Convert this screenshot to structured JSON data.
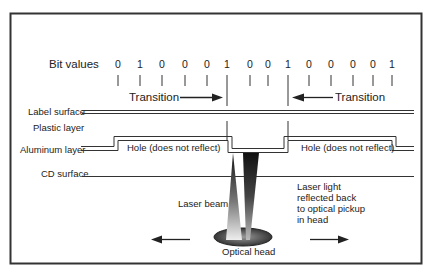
{
  "diagram": {
    "title_label": "Bit values",
    "bits": [
      "0",
      "1",
      "0",
      "0",
      "0",
      "1",
      "0",
      "0",
      "1",
      "0",
      "0",
      "0",
      "0",
      "1"
    ],
    "bit_x": [
      118,
      140,
      162,
      185,
      207,
      227,
      250,
      268,
      288,
      309,
      331,
      353,
      373,
      392
    ],
    "transition_left": "Transition",
    "transition_right": "Transition",
    "layers": {
      "label_surface": "Label surface",
      "plastic_layer": "Plastic layer",
      "aluminum_layer": "Aluminum layer",
      "cd_surface": "CD surface"
    },
    "hole_left": "Hole (does not reflect)",
    "hole_right": "Hole (does not reflect)",
    "laser_beam": "Laser beam",
    "reflected": [
      "Laser light",
      "reflected back",
      "to optical pickup",
      "in head"
    ],
    "optical_head": "Optical head",
    "colors": {
      "frame": "#333333",
      "line": "#333333",
      "text": "#222222",
      "background": "#ffffff"
    }
  }
}
